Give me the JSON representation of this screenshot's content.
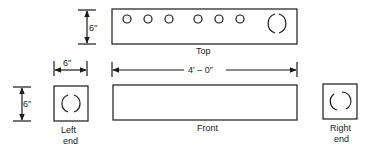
{
  "diagram": {
    "type": "orthographic-projection",
    "views": {
      "top": {
        "label": "Top",
        "small_holes": 6,
        "large_opening": 1
      },
      "front": {
        "label": "Front"
      },
      "left_end": {
        "label_line1": "Left",
        "label_line2": "end"
      },
      "right_end": {
        "label_line1": "Right",
        "label_line2": "end"
      }
    },
    "dimensions": {
      "top_height": "6″",
      "end_width": "6″",
      "end_height": "6″",
      "overall_length": "4′ – 0″"
    },
    "colors": {
      "line": "#1a1a1a",
      "background": "#ffffff"
    }
  }
}
